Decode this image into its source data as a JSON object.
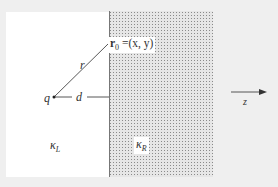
{
  "diagram": {
    "colors": {
      "background": "#efefef",
      "left_region": "#ffffff",
      "right_region_fill": "#e6e6e6",
      "right_region_dots": "#8a8a8a",
      "lines": "#444444"
    },
    "labels": {
      "point_label_bold": "r",
      "point_label_sub": "0",
      "point_label_rest": " =(x, y)",
      "r": "r",
      "charge": "q",
      "distance": "d",
      "axis": "z",
      "kappa_left_sym": "κ",
      "kappa_left_sub": "L",
      "kappa_right_sym": "κ",
      "kappa_right_sub": "R"
    },
    "regions": [
      {
        "name": "left",
        "material": "κ_L",
        "pattern": "plain"
      },
      {
        "name": "right",
        "material": "κ_R",
        "pattern": "dotted"
      }
    ]
  }
}
